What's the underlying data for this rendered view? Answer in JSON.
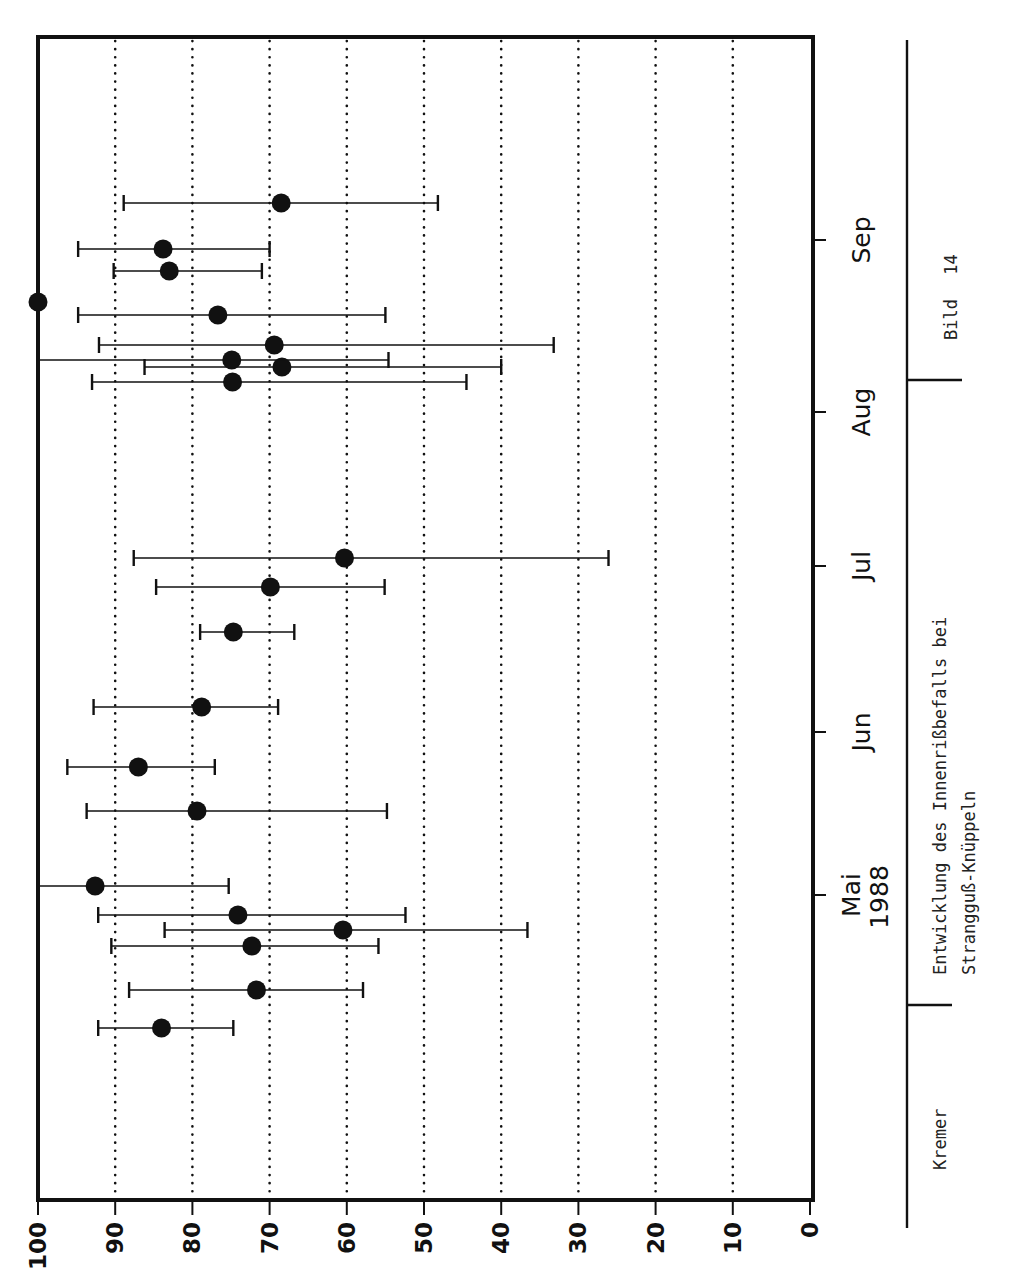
{
  "chart_data": {
    "type": "scatter",
    "subtype": "dot plot with horizontal error bars (rotated page, landscape figure)",
    "title": "Entwicklung des Innenrißbefalls bei Strangguß-Knüppeln",
    "xlabel": "",
    "ylabel": "",
    "value_axis": {
      "orientation": "horizontal (bottom)",
      "range": [
        100,
        0
      ],
      "ticks": [
        100,
        90,
        80,
        70,
        60,
        50,
        40,
        30,
        20,
        10,
        0
      ],
      "tick_labels": [
        "100",
        "90",
        "80",
        "70",
        "60",
        "50",
        "40",
        "30",
        "20",
        "10",
        "0"
      ],
      "gridlines": "dotted at every 10"
    },
    "time_axis": {
      "orientation": "vertical (right side)",
      "tick_labels": [
        {
          "label": "Mai",
          "sublabel": "1988",
          "pos": 895
        },
        {
          "label": "Jun",
          "sublabel": "",
          "pos": 732
        },
        {
          "label": "Jul",
          "sublabel": "",
          "pos": 566
        },
        {
          "label": "Aug",
          "sublabel": "",
          "pos": 412
        },
        {
          "label": "Sep",
          "sublabel": "",
          "pos": 240
        }
      ]
    },
    "points": [
      {
        "t": 1028,
        "value": 84,
        "low": 74.7,
        "high": 92.2
      },
      {
        "t": 990,
        "value": 71.7,
        "low": 57.9,
        "high": 88.2
      },
      {
        "t": 946,
        "value": 72.3,
        "low": 55.9,
        "high": 90.5
      },
      {
        "t": 930,
        "value": 60.5,
        "low": 36.6,
        "high": 83.6
      },
      {
        "t": 915,
        "value": 74.1,
        "low": 52.4,
        "high": 92.2
      },
      {
        "t": 886,
        "value": 92.6,
        "low": 75.3,
        "high": 100
      },
      {
        "t": 811,
        "value": 79.4,
        "low": 54.8,
        "high": 93.7
      },
      {
        "t": 767,
        "value": 87,
        "low": 77.1,
        "high": 96.2
      },
      {
        "t": 707,
        "value": 78.8,
        "low": 68.9,
        "high": 92.8
      },
      {
        "t": 632,
        "value": 74.7,
        "low": 66.8,
        "high": 79.0
      },
      {
        "t": 587,
        "value": 69.9,
        "low": 55.1,
        "high": 84.7
      },
      {
        "t": 558,
        "value": 60.3,
        "low": 26.1,
        "high": 87.6
      },
      {
        "t": 382,
        "value": 74.8,
        "low": 44.5,
        "high": 93.0
      },
      {
        "t": 367,
        "value": 68.4,
        "low": 40.0,
        "high": 86.2
      },
      {
        "t": 360,
        "value": 74.9,
        "low": 54.6,
        "high": 100
      },
      {
        "t": 345,
        "value": 69.4,
        "low": 33.2,
        "high": 92.1
      },
      {
        "t": 315,
        "value": 76.7,
        "low": 55.0,
        "high": 94.8
      },
      {
        "t": 302,
        "value": 100,
        "low": null,
        "high": null
      },
      {
        "t": 271,
        "value": 83,
        "low": 71.0,
        "high": 90.2
      },
      {
        "t": 249,
        "value": 83.8,
        "low": 70.0,
        "high": 94.8
      },
      {
        "t": 203,
        "value": 68.5,
        "low": 48.2,
        "high": 88.9
      }
    ],
    "note": "t = vertical pixel position along time axis (Mai 1988 at bottom → Sep at top); values read from horizontal scale 100→0"
  },
  "title_block": {
    "author": "Kremer",
    "caption_line1": "Entwicklung des Innenrißbefalls bei",
    "caption_line2": "Strangguß-Knüppeln",
    "figure_label": "Bild",
    "figure_number": "14"
  },
  "colors": {
    "ink": "#111111",
    "paper": "#ffffff"
  }
}
